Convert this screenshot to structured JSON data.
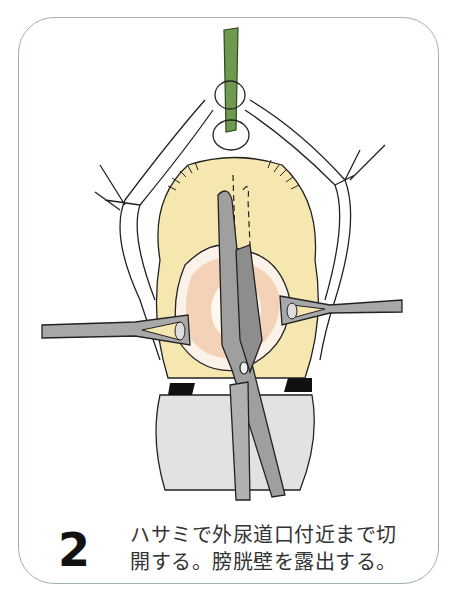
{
  "figure": {
    "step_number": "2",
    "caption_lines": [
      "ハサミで外尿道口付近まで切",
      "開する。膀胱壁を露出する。"
    ],
    "colors": {
      "frame_border": "#9fb3a6",
      "catheter": "#6e9a4f",
      "tissue_yellow": "#f6e7b0",
      "bladder_pink": "#e8b48f",
      "instrument_gray": "#a8a8a8",
      "drape_gray": "#d9d9d9"
    },
    "illustration_elements": [
      "catheter",
      "urethral-opening",
      "labia-retracted-with-sutures",
      "scissors",
      "left-retractor-clamp",
      "right-retractor-clamp",
      "exposed-bladder-wall",
      "drape"
    ]
  }
}
